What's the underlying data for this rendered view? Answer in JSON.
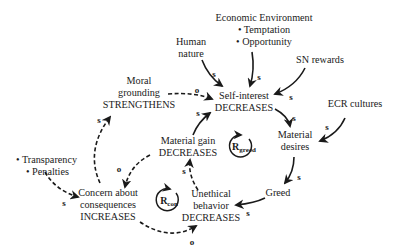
{
  "diagram": {
    "type": "causal-loop",
    "nodes": {
      "economic_environment": {
        "title": "Economic Environment",
        "bullets": [
          "• Temptation",
          "• Opportunity"
        ]
      },
      "human_nature": {
        "line1": "Human",
        "line2": "nature"
      },
      "sn_rewards": {
        "label": "SN rewards"
      },
      "moral_grounding": {
        "line1": "Moral",
        "line2": "grounding",
        "line3": "STRENGTHENS"
      },
      "self_interest": {
        "line1": "Self-interest",
        "line2": "DECREASES"
      },
      "ecr_cultures": {
        "label": "ECR cultures"
      },
      "material_desires": {
        "line1": "Material",
        "line2": "desires"
      },
      "material_gain": {
        "line1": "Material gain",
        "line2": "DECREASES"
      },
      "transparency_penalties": {
        "bullets": [
          "• Transparency",
          "• Penalties"
        ]
      },
      "concern": {
        "line1": "Concern about",
        "line2": "consequences",
        "line3": "INCREASES"
      },
      "unethical_behavior": {
        "line1": "Unethical",
        "line2": "behavior",
        "line3": "DECREASES"
      },
      "greed": {
        "label": "Greed"
      }
    },
    "loops": {
      "greed": {
        "letter": "R",
        "sub": "greed"
      },
      "con": {
        "letter": "R",
        "sub": "con"
      }
    },
    "polarities": {
      "human_to_self": "s",
      "econ_to_self": "s",
      "sn_to_self": "s",
      "moral_to_self": "o",
      "gain_to_self": "s",
      "self_to_desires": "s",
      "ecr_to_desires": "s",
      "desires_to_greed": "s",
      "greed_to_unethical": "s",
      "unethical_to_gain": "s",
      "gain_to_concern": "o",
      "concern_to_unethical": "o",
      "concern_to_moral": "s",
      "transparency_to_concern": "s"
    },
    "colors": {
      "ink": "#1a1a1a",
      "background": "#ffffff"
    }
  }
}
